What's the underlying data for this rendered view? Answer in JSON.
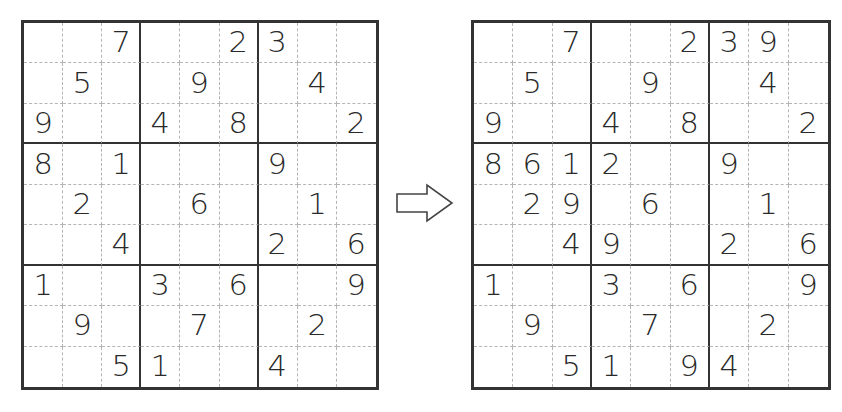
{
  "puzzle": {
    "given": [
      [
        "",
        "",
        "7",
        "",
        "",
        "2",
        "3",
        "",
        ""
      ],
      [
        "",
        "5",
        "",
        "",
        "9",
        "",
        "",
        "4",
        ""
      ],
      [
        "9",
        "",
        "",
        "4",
        "",
        "8",
        "",
        "",
        "2"
      ],
      [
        "8",
        "",
        "1",
        "",
        "",
        "",
        "9",
        "",
        ""
      ],
      [
        "",
        "2",
        "",
        "",
        "6",
        "",
        "",
        "1",
        ""
      ],
      [
        "",
        "",
        "4",
        "",
        "",
        "",
        "2",
        "",
        "6"
      ],
      [
        "1",
        "",
        "",
        "3",
        "",
        "6",
        "",
        "",
        "9"
      ],
      [
        "",
        "9",
        "",
        "",
        "7",
        "",
        "",
        "2",
        ""
      ],
      [
        "",
        "",
        "5",
        "1",
        "",
        "",
        "4",
        "",
        ""
      ]
    ],
    "after_step": [
      [
        "",
        "",
        "7",
        "",
        "",
        "2",
        "3",
        "9",
        ""
      ],
      [
        "",
        "5",
        "",
        "",
        "9",
        "",
        "",
        "4",
        ""
      ],
      [
        "9",
        "",
        "",
        "4",
        "",
        "8",
        "",
        "",
        "2"
      ],
      [
        "8",
        "6",
        "1",
        "2",
        "",
        "",
        "9",
        "",
        ""
      ],
      [
        "",
        "2",
        "9",
        "",
        "6",
        "",
        "",
        "1",
        ""
      ],
      [
        "",
        "",
        "4",
        "9",
        "",
        "",
        "2",
        "",
        "6"
      ],
      [
        "1",
        "",
        "",
        "3",
        "",
        "6",
        "",
        "",
        "9"
      ],
      [
        "",
        "9",
        "",
        "",
        "7",
        "",
        "",
        "2",
        ""
      ],
      [
        "",
        "",
        "5",
        "1",
        "",
        "9",
        "4",
        "",
        ""
      ]
    ]
  },
  "arrow": {
    "icon": "right-arrow-outline-icon",
    "direction": "right"
  },
  "colors": {
    "grid_line": "#333333",
    "minor_line": "#b5b5b5",
    "digit": "#2a2a2a",
    "background": "#ffffff"
  }
}
